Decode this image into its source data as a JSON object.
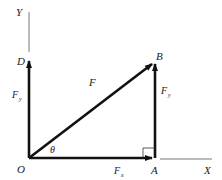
{
  "diagram": {
    "points": {
      "O": "O",
      "A": "A",
      "B": "B",
      "D": "D"
    },
    "axes": {
      "x": "X",
      "y": "Y"
    },
    "vectors": {
      "F": "F",
      "Fx": "F",
      "Fx_sub": "x",
      "Fy_left": "F",
      "Fy_left_sub": "y",
      "Fy_right": "F",
      "Fy_right_sub": "y"
    },
    "angle": "θ",
    "colors": {
      "line": "#111111",
      "axis": "#555555",
      "background": "#ffffff"
    }
  }
}
